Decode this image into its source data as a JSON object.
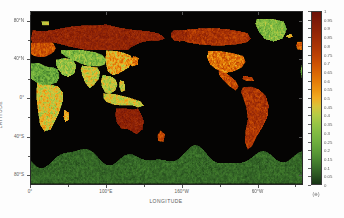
{
  "chart_data": {
    "type": "heatmap",
    "title": "",
    "xlabel": "LONGITUDE",
    "ylabel": "LATITUDE",
    "xlim": [
      0,
      360
    ],
    "ylim": [
      -90,
      90
    ],
    "grid": false,
    "projection": "equirectangular, Pacific-centred (0°E → 360°E)",
    "background_color": "#050403",
    "xticks": [
      {
        "value": 0,
        "label": "0°"
      },
      {
        "value": 100,
        "label": "100°E"
      },
      {
        "value": 200,
        "label": "160°W"
      },
      {
        "value": 300,
        "label": "60°W"
      }
    ],
    "xticks_minor": [
      50,
      150,
      250,
      350
    ],
    "yticks": [
      {
        "value": 80,
        "label": "80°N"
      },
      {
        "value": 40,
        "label": "40°N"
      },
      {
        "value": 0,
        "label": "0°"
      },
      {
        "value": -40,
        "label": "40°S"
      },
      {
        "value": -80,
        "label": "80°S"
      }
    ],
    "yticks_minor": [
      60,
      20,
      -20,
      -60
    ],
    "colorbar": {
      "unit_label": "(※)",
      "vmin": 0,
      "vmax": 1,
      "orientation": "vertical",
      "position": "right",
      "tick_labels": [
        "1",
        "0.95",
        "0.9",
        "0.85",
        "0.8",
        "0.75",
        "0.7",
        "0.65",
        "0.6",
        "0.55",
        "0.5",
        "0.45",
        "0.4",
        "0.35",
        "0.3",
        "0.25",
        "0.2",
        "0.15",
        "0.1",
        "0.05",
        "0"
      ],
      "tick_values": [
        1,
        0.95,
        0.9,
        0.85,
        0.8,
        0.75,
        0.7,
        0.65,
        0.6,
        0.55,
        0.5,
        0.45,
        0.4,
        0.35,
        0.3,
        0.25,
        0.2,
        0.15,
        0.1,
        0.05,
        0
      ],
      "colormap_stops": [
        {
          "value": 1.0,
          "color": "#6b1208"
        },
        {
          "value": 0.95,
          "color": "#7d1a08"
        },
        {
          "value": 0.9,
          "color": "#8c2207"
        },
        {
          "value": 0.85,
          "color": "#9c2b06"
        },
        {
          "value": 0.8,
          "color": "#ab3505"
        },
        {
          "value": 0.75,
          "color": "#bc4104"
        },
        {
          "value": 0.7,
          "color": "#cc5104"
        },
        {
          "value": 0.65,
          "color": "#d96505"
        },
        {
          "value": 0.6,
          "color": "#e47a07"
        },
        {
          "value": 0.55,
          "color": "#ec9210"
        },
        {
          "value": 0.5,
          "color": "#f2ab22"
        },
        {
          "value": 0.45,
          "color": "#d7c43a"
        },
        {
          "value": 0.4,
          "color": "#b4cb45"
        },
        {
          "value": 0.35,
          "color": "#97c445"
        },
        {
          "value": 0.3,
          "color": "#82bb42"
        },
        {
          "value": 0.25,
          "color": "#71b03e"
        },
        {
          "value": 0.2,
          "color": "#5fa038"
        },
        {
          "value": 0.15,
          "color": "#4c8a31"
        },
        {
          "value": 0.1,
          "color": "#3a702a"
        },
        {
          "value": 0.05,
          "color": "#2a5421"
        },
        {
          "value": 0.0,
          "color": "#173415"
        }
      ]
    },
    "regions": [
      {
        "name": "Northern Eurasia (boreal)",
        "value_range": [
          0.75,
          1.0
        ],
        "dominant_color": "#8c2207"
      },
      {
        "name": "Europe",
        "value_range": [
          0.55,
          0.9
        ],
        "dominant_color": "#d96505"
      },
      {
        "name": "South & Southeast Asia",
        "value_range": [
          0.25,
          0.6
        ],
        "dominant_color": "#97c445"
      },
      {
        "name": "Central Asia / Tibet",
        "value_range": [
          0.05,
          0.35
        ],
        "dominant_color": "#3a702a"
      },
      {
        "name": "North America",
        "value_range": [
          0.7,
          1.0
        ],
        "dominant_color": "#7d1a08"
      },
      {
        "name": "US Midwest / Great Lakes",
        "value_range": [
          0.45,
          0.7
        ],
        "dominant_color": "#e47a07"
      },
      {
        "name": "South America",
        "value_range": [
          0.6,
          0.95
        ],
        "dominant_color": "#9c2b06"
      },
      {
        "name": "Sub-Saharan Africa",
        "value_range": [
          0.2,
          0.6
        ],
        "dominant_color": "#82bb42"
      },
      {
        "name": "Australia",
        "value_range": [
          0.75,
          1.0
        ],
        "dominant_color": "#6b1208"
      },
      {
        "name": "Antarctica",
        "value_range": [
          0.0,
          0.15
        ],
        "dominant_color": "#1d3d18"
      },
      {
        "name": "Oceans (masked)",
        "value_range": [
          null,
          null
        ],
        "dominant_color": "#050403"
      }
    ]
  }
}
